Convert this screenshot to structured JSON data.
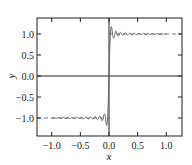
{
  "chart_data": {
    "type": "line",
    "title": "",
    "xlabel": "x",
    "ylabel": "y",
    "xlim": [
      -1.25,
      1.25
    ],
    "ylim": [
      -1.4,
      1.4
    ],
    "grid": false,
    "legend": null,
    "x_ticks": [
      -1.0,
      -0.5,
      0.0,
      0.5,
      1.0
    ],
    "x_tick_labels": [
      "−1.0",
      "−0.5",
      "0.0",
      "0.5",
      "1.0"
    ],
    "y_ticks": [
      1.0,
      0.5,
      0.0,
      -0.5,
      -1.0
    ],
    "y_tick_labels": [
      "1.0",
      "0.5",
      "0.0",
      "−0.5",
      "−1.0"
    ],
    "reference_lines": {
      "zero_axes": true,
      "dashed_levels": [
        1.0,
        -1.0
      ],
      "dashed_description": "Dashed lines at y = 1 (x > 0) and y = -1 (x < 0), spanning the plot frame"
    },
    "series": [
      {
        "name": "Gibbs oscillation (partial Fourier approximation of sign(x))",
        "model": "y = (2/pi) * Si(omega * x)",
        "omega": 78.5,
        "x_range": [
          -1.0,
          1.0
        ],
        "color": "#666666",
        "approx_points": [
          {
            "x": -1.0,
            "y": -1.0
          },
          {
            "x": -0.8,
            "y": -1.0
          },
          {
            "x": -0.6,
            "y": -1.0
          },
          {
            "x": -0.4,
            "y": -1.0
          },
          {
            "x": -0.2,
            "y": -1.0
          },
          {
            "x": -0.1,
            "y": -0.97
          },
          {
            "x": -0.04,
            "y": -1.18
          },
          {
            "x": -0.02,
            "y": -0.95
          },
          {
            "x": 0.0,
            "y": 0.0
          },
          {
            "x": 0.02,
            "y": 0.95
          },
          {
            "x": 0.04,
            "y": 1.18
          },
          {
            "x": 0.1,
            "y": 0.97
          },
          {
            "x": 0.2,
            "y": 1.0
          },
          {
            "x": 0.4,
            "y": 1.0
          },
          {
            "x": 0.6,
            "y": 1.0
          },
          {
            "x": 0.8,
            "y": 1.0
          },
          {
            "x": 1.0,
            "y": 1.0
          }
        ],
        "peak_overshoot": 1.18
      }
    ]
  },
  "colors": {
    "frame": "#222222",
    "axes": "#222222",
    "curve": "#666666",
    "dashed": "#555555",
    "background": "#ffffff"
  }
}
